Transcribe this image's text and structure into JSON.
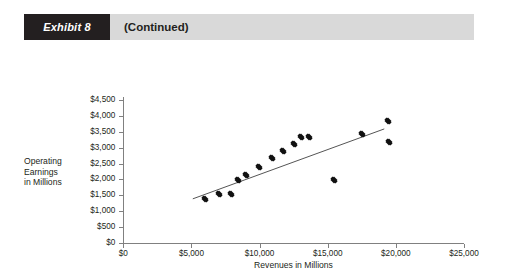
{
  "header": {
    "badge_label": "Exhibit 8",
    "title": "(Continued)"
  },
  "colors": {
    "badge_bg": "#231f20",
    "header_bg": "#d9d9d9",
    "axis": "#808080",
    "marker": "#111111",
    "trendline": "#555555"
  },
  "chart_data": {
    "type": "scatter",
    "title": "",
    "xlabel": "Revenues in Millions",
    "ylabel": "Operating Earnings in Millions",
    "ylabel_lines": [
      "Operating",
      "Earnings",
      "in Millions"
    ],
    "xlim": [
      0,
      25000
    ],
    "ylim": [
      0,
      4500
    ],
    "xticks": [
      0,
      5000,
      10000,
      15000,
      20000,
      25000
    ],
    "xtick_labels": [
      "$0",
      "$5,000",
      "$10,000",
      "$15,000",
      "$20,000",
      "$25,000"
    ],
    "yticks": [
      0,
      500,
      1000,
      1500,
      2000,
      2500,
      3000,
      3500,
      4000,
      4500
    ],
    "ytick_labels": [
      "$0",
      "$500",
      "$1,000",
      "$1,500",
      "$2,000",
      "$2,500",
      "$3,000",
      "$3,500",
      "$4,000",
      "$4,500"
    ],
    "grid": false,
    "legend": "none",
    "series": [
      {
        "name": "Companies",
        "marker": "diamond",
        "points": [
          {
            "x": 6020,
            "y": 1400
          },
          {
            "x": 6990,
            "y": 1550
          },
          {
            "x": 7870,
            "y": 1550
          },
          {
            "x": 8400,
            "y": 1990
          },
          {
            "x": 9020,
            "y": 2130
          },
          {
            "x": 9950,
            "y": 2400
          },
          {
            "x": 10930,
            "y": 2660
          },
          {
            "x": 11750,
            "y": 2900
          },
          {
            "x": 12560,
            "y": 3120
          },
          {
            "x": 13010,
            "y": 3330
          },
          {
            "x": 13590,
            "y": 3330
          },
          {
            "x": 15440,
            "y": 1990
          },
          {
            "x": 17480,
            "y": 3430
          },
          {
            "x": 19450,
            "y": 3840
          },
          {
            "x": 19480,
            "y": 3190
          }
        ]
      }
    ],
    "trendline": {
      "name": "Linear fit",
      "x0": 5100,
      "y0": 1390,
      "x1": 19150,
      "y1": 3590
    }
  }
}
